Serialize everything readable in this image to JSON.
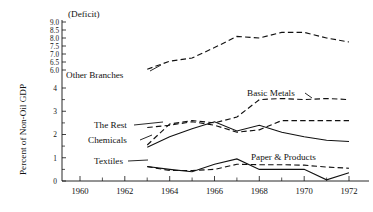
{
  "chart_data": {
    "type": "line",
    "title": "",
    "subtitle": "",
    "xlabel": "",
    "ylabel": "Percent of Non-Oil GDP",
    "top_annotation": "(Deficit)",
    "x": [
      1960,
      1961,
      1962,
      1963,
      1964,
      1965,
      1966,
      1967,
      1968,
      1969,
      1970,
      1971,
      1972
    ],
    "xlim": [
      1959.2,
      1972.8
    ],
    "xticks_major": [
      1960,
      1962,
      1964,
      1966,
      1968,
      1970,
      1972
    ],
    "xtick_labels": [
      "1960",
      "1962",
      "1964",
      "1966",
      "1968",
      "1970",
      "1972"
    ],
    "xticks_minor": [
      1961,
      1963,
      1965,
      1967,
      1969,
      1971
    ],
    "grid": false,
    "legend_position": "inline-annotations",
    "y_axis_note": "broken axis: lower band 0-4 linear, upper band 6.0-9.0 in 0.5 steps",
    "yticks_lower": [
      0,
      1,
      2,
      3,
      4
    ],
    "ytick_labels_lower": [
      "0",
      "1",
      "2",
      "3",
      "4"
    ],
    "yticks_upper": [
      6.0,
      6.5,
      7.0,
      7.5,
      8.0,
      8.5,
      9.0
    ],
    "ytick_labels_upper": [
      "6.0",
      "6.5",
      "7.0",
      "7.5",
      "8.0",
      "8.5",
      "9.0"
    ],
    "series": [
      {
        "name": "Other Branches",
        "style": "dashed",
        "label_x": 1960.2,
        "label_y_band": "upper",
        "x": [
          1963,
          1964,
          1965,
          1966,
          1967,
          1968,
          1969,
          1970,
          1971,
          1972
        ],
        "values": [
          6.05,
          6.55,
          6.75,
          7.4,
          8.1,
          8.0,
          8.35,
          8.35,
          8.0,
          7.75
        ]
      },
      {
        "name": "Basic Metals",
        "style": "dashed",
        "x": [
          1963,
          1964,
          1965,
          1966,
          1967,
          1968,
          1969,
          1970,
          1971,
          1972
        ],
        "values": [
          1.55,
          2.45,
          2.6,
          2.5,
          2.75,
          3.5,
          3.55,
          3.5,
          3.55,
          3.5
        ]
      },
      {
        "name": "The Rest",
        "style": "dashed",
        "x": [
          1963,
          1964,
          1965,
          1966,
          1967,
          1968,
          1969,
          1970,
          1971,
          1972
        ],
        "values": [
          2.3,
          2.4,
          2.55,
          2.4,
          2.1,
          2.2,
          2.6,
          2.6,
          2.6,
          2.6
        ]
      },
      {
        "name": "Chemicals",
        "style": "solid",
        "x": [
          1963,
          1964,
          1965,
          1966,
          1967,
          1968,
          1969,
          1970,
          1971,
          1972
        ],
        "values": [
          1.45,
          1.9,
          2.25,
          2.55,
          2.15,
          2.4,
          2.1,
          1.9,
          1.75,
          1.7
        ]
      },
      {
        "name": "Textiles",
        "style": "solid",
        "x": [
          1963,
          1964,
          1965,
          1966,
          1967,
          1968,
          1969,
          1970,
          1971,
          1972
        ],
        "values": [
          0.62,
          0.5,
          0.4,
          0.72,
          0.95,
          0.5,
          0.5,
          0.5,
          0.05,
          0.35
        ]
      },
      {
        "name": "Paper & Products",
        "style": "dashed",
        "x": [
          1963,
          1964,
          1965,
          1966,
          1967,
          1968,
          1969,
          1970,
          1971,
          1972
        ],
        "values": [
          0.62,
          0.45,
          0.45,
          0.5,
          0.72,
          0.7,
          0.7,
          0.68,
          0.6,
          0.55
        ]
      }
    ],
    "annotations": [
      {
        "text": "Other Branches",
        "x": 66,
        "y": 75
      },
      {
        "text": "Basic Metals",
        "x": 247,
        "y": 96
      },
      {
        "text": "The Rest",
        "x": 95,
        "y": 128
      },
      {
        "text": "Chemicals",
        "x": 92,
        "y": 142
      },
      {
        "text": "Textiles",
        "x": 96,
        "y": 164
      },
      {
        "text": "Paper & Products",
        "x": 253,
        "y": 160
      },
      {
        "text": "(Deficit)",
        "x": 73,
        "y": 17
      }
    ]
  }
}
